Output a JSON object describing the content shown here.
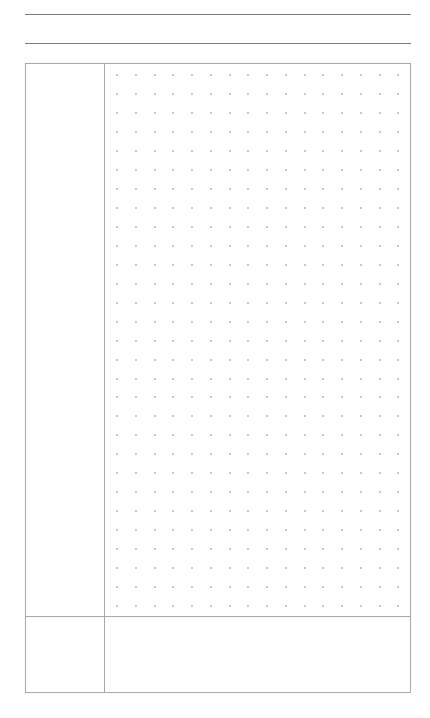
{
  "page": {
    "type": "dot-grid planner page",
    "header_lines": 2,
    "dot_grid": {
      "rows": 29,
      "columns": 16,
      "spacing_x": 18.75,
      "spacing_y": 18.97,
      "dot_color": "#b5b5b5"
    },
    "line_color": "#7a7a7a",
    "frame_color": "#a8a8a8",
    "sections": [
      {
        "name": "main-label-column",
        "text": ""
      },
      {
        "name": "main-dot-area",
        "text": ""
      },
      {
        "name": "footer-label-column",
        "text": ""
      },
      {
        "name": "footer-notes-area",
        "text": ""
      }
    ]
  }
}
